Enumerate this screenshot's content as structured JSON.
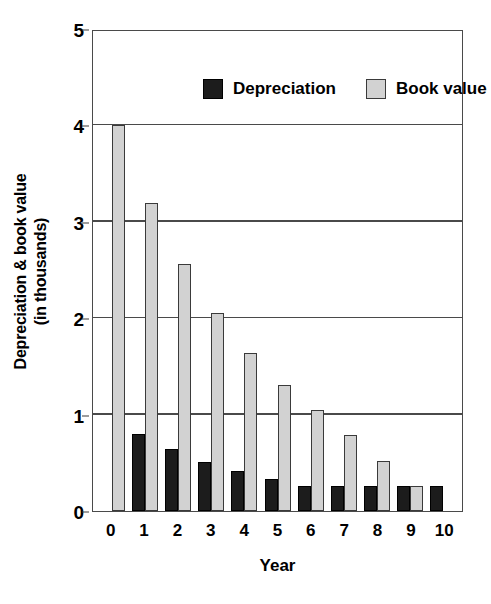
{
  "chart_data": {
    "type": "bar",
    "title": "",
    "xlabel": "Year",
    "ylabel": "Depreciation & book value (in thousands)",
    "ylabel_line1": "Depreciation & book value",
    "ylabel_line2": "(in thousands)",
    "categories": [
      "0",
      "1",
      "2",
      "3",
      "4",
      "5",
      "6",
      "7",
      "8",
      "9",
      "10"
    ],
    "series": [
      {
        "name": "Depreciation",
        "color": "#1c1c1c",
        "values": [
          0,
          0.8,
          0.64,
          0.51,
          0.41,
          0.33,
          0.26,
          0.26,
          0.26,
          0.26,
          0.26
        ]
      },
      {
        "name": "Book value",
        "color": "#d2d2d2",
        "values": [
          4.0,
          3.2,
          2.56,
          2.05,
          1.64,
          1.31,
          1.05,
          0.79,
          0.52,
          0.26,
          0
        ]
      }
    ],
    "ylim": [
      0,
      5
    ],
    "yticks": [
      0,
      1,
      2,
      3,
      4,
      5
    ],
    "ytick_labels": [
      "0",
      "1",
      "2",
      "3",
      "4",
      "5"
    ],
    "grid": true,
    "grid_axis": "y",
    "legend_position": "top-inside",
    "axis_color": "#4a4a4a"
  }
}
